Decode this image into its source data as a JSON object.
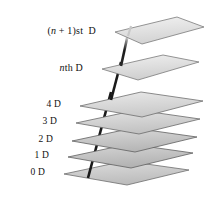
{
  "figure": {
    "kind": "layered-planes-diagram",
    "background_color": "#ffffff",
    "labels": [
      {
        "id": "label-n-plus-1",
        "text_prefix": "(",
        "var": "n",
        "text_mid": " + 1)st  D",
        "plain": "(n + 1)st  D",
        "anchor_x": 111,
        "anchor_y": 31
      },
      {
        "id": "label-nth",
        "text_prefix": "",
        "var": "n",
        "text_mid": "th D",
        "plain": "nth D",
        "anchor_x": 98,
        "anchor_y": 68
      },
      {
        "id": "label-4d",
        "plain": "4 D",
        "anchor_x": 76,
        "anchor_y": 105
      },
      {
        "id": "label-3d",
        "plain": "3 D",
        "anchor_x": 72,
        "anchor_y": 122
      },
      {
        "id": "label-2d",
        "plain": "2 D",
        "anchor_x": 68,
        "anchor_y": 140
      },
      {
        "id": "label-1d",
        "plain": "1 D",
        "anchor_x": 64,
        "anchor_y": 156
      },
      {
        "id": "label-0d",
        "plain": "0 D",
        "anchor_x": 60,
        "anchor_y": 173
      }
    ],
    "planes": [
      {
        "id": "plane-n-plus-1",
        "label": "(n + 1)st D",
        "left_tip_x": 115,
        "left_tip_y": 32,
        "width": 88,
        "depth": 30,
        "fill_top": "#efefef",
        "fill_bottom": "#dcdcdc",
        "edge_color": "#7a7a7a"
      },
      {
        "id": "plane-nth",
        "label": "nth D",
        "left_tip_x": 102,
        "left_tip_y": 69,
        "width": 88,
        "depth": 30,
        "fill_top": "#ececec",
        "fill_bottom": "#d8d8d8",
        "edge_color": "#7a7a7a"
      },
      {
        "id": "plane-4d",
        "label": "4 D",
        "left_tip_x": 80,
        "left_tip_y": 106,
        "width": 88,
        "depth": 30,
        "fill_top": "#e4e4e4",
        "fill_bottom": "#cfcfcf",
        "edge_color": "#6f6f6f"
      },
      {
        "id": "plane-3d",
        "label": "3 D",
        "left_tip_x": 76,
        "left_tip_y": 123,
        "width": 88,
        "depth": 30,
        "fill_top": "#dedede",
        "fill_bottom": "#c7c7c7",
        "edge_color": "#6a6a6a"
      },
      {
        "id": "plane-2d",
        "label": "2 D",
        "left_tip_x": 72,
        "left_tip_y": 141,
        "width": 88,
        "depth": 30,
        "fill_top": "#d6d6d6",
        "fill_bottom": "#bdbdbd",
        "edge_color": "#5f5f5f"
      },
      {
        "id": "plane-1d",
        "label": "1 D",
        "left_tip_x": 68,
        "left_tip_y": 157,
        "width": 88,
        "depth": 30,
        "fill_top": "#d2d2d2",
        "fill_bottom": "#b9b9b9",
        "edge_color": "#5f5f5f"
      },
      {
        "id": "plane-0d",
        "label": "0 D",
        "left_tip_x": 64,
        "left_tip_y": 174,
        "width": 88,
        "depth": 30,
        "fill_top": "#d9d9d9",
        "fill_bottom": "#c2c2c2",
        "edge_color": "#6a6a6a"
      }
    ],
    "arrow": {
      "id": "vertical-arrow",
      "description": "thick dark arrow rising through all planes",
      "color": "#1a1a1a",
      "x_bottom": 88,
      "y_bottom": 178,
      "x_top": 129,
      "y_top": 26,
      "thickness": 2.6
    }
  }
}
